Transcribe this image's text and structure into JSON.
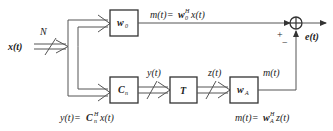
{
  "input": {
    "label": "x(t)",
    "bus_width": "N"
  },
  "blocks": {
    "w0": {
      "name": "w",
      "sub": "0"
    },
    "cn": {
      "name": "C",
      "sub": "n"
    },
    "t": {
      "name": "T",
      "sub": ""
    },
    "wa": {
      "name": "w",
      "sub": "A"
    }
  },
  "signals": {
    "top_formula": {
      "lhs": "m(t)=",
      "w": "w",
      "sup": "H",
      "sub": "0",
      "rhs": "x(t)"
    },
    "y": "y(t)",
    "z": "z(t)",
    "m": "m(t)",
    "e": "e(t)"
  },
  "summer": {
    "plus": "+",
    "minus": "−"
  },
  "formulas": {
    "y_eq": {
      "lhs": "y(t)=",
      "c": "C",
      "sup": "H",
      "sub": "n",
      "rhs": "x(t)"
    },
    "m_eq": {
      "lhs": "m(t)=",
      "w": "w",
      "sup": "H",
      "sub": "A",
      "rhs": "z(t)"
    }
  }
}
